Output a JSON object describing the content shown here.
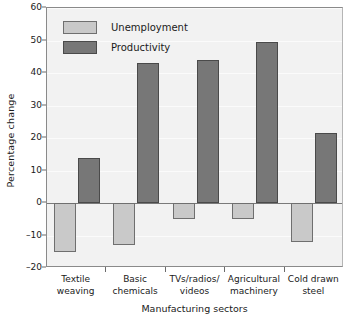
{
  "chart_data": {
    "type": "bar",
    "title": "",
    "xlabel": "Manufacturing sectors",
    "ylabel": "Percentage change",
    "ylim": [
      -20,
      60
    ],
    "ytick_step": 10,
    "grid": true,
    "legend_position": "top-left-inside",
    "categories": [
      "Textile\nweaving",
      "Basic\nchemicals",
      "TVs/radios/\nvideos",
      "Agricultural\nmachinery",
      "Cold drawn\nsteel"
    ],
    "category_lines": [
      [
        "Textile",
        "weaving"
      ],
      [
        "Basic",
        "chemicals"
      ],
      [
        "TVs/radios/",
        "videos"
      ],
      [
        "Agricultural",
        "machinery"
      ],
      [
        "Cold drawn",
        "steel"
      ]
    ],
    "yticks": [
      60,
      50,
      40,
      30,
      20,
      10,
      0,
      -10,
      -20
    ],
    "ytick_labels": [
      "60",
      "50",
      "40",
      "30",
      "20",
      "10",
      "0",
      "–10",
      "–20"
    ],
    "series": [
      {
        "name": "Unemployment",
        "color": "#c9c9c9",
        "values": [
          -15,
          -13,
          -5,
          -5,
          -12
        ]
      },
      {
        "name": "Productivity",
        "color": "#777777",
        "values": [
          14,
          43,
          44,
          49.5,
          21.5
        ]
      }
    ]
  },
  "legend": {
    "items": [
      {
        "label": "Unemployment",
        "swatch": "unemployment"
      },
      {
        "label": "Productivity",
        "swatch": "productivity"
      }
    ]
  },
  "colors": {
    "unemployment": "#c9c9c9",
    "productivity": "#777777",
    "plot_background": "#f2f2f2",
    "axis": "#8a8a8a",
    "gridline": "#fbfbfb",
    "text": "#1a1a1a"
  }
}
